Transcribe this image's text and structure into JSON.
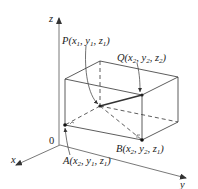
{
  "diagram": {
    "type": "3d-rectangular-box",
    "axes": {
      "x": "x",
      "y": "y",
      "z": "z",
      "origin": "0"
    },
    "points": {
      "P": {
        "name": "P",
        "coords": [
          "x",
          "1",
          "y",
          "1",
          "z",
          "1"
        ]
      },
      "Q": {
        "name": "Q",
        "coords": [
          "x",
          "2",
          "y",
          "2",
          "z",
          "2"
        ]
      },
      "A": {
        "name": "A",
        "coords": [
          "x",
          "2",
          "y",
          "1",
          "z",
          "1"
        ]
      },
      "B": {
        "name": "B",
        "coords": [
          "x",
          "2",
          "y",
          "2",
          "z",
          "1"
        ]
      }
    },
    "colors": {
      "line": "#333333",
      "text": "#222222"
    }
  }
}
